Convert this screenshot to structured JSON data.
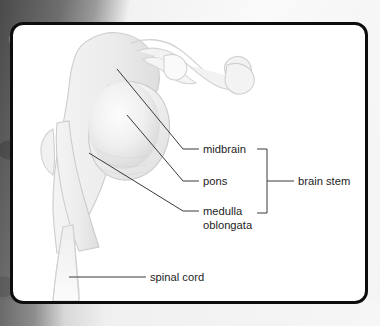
{
  "figure": {
    "background_color": "#ffffff",
    "frame_color": "#0d0d0d",
    "structure_fill": "#ececec",
    "structure_stroke": "#c8c8c8",
    "leader_line_color": "#333333",
    "labels": [
      {
        "id": "midbrain",
        "text": "midbrain"
      },
      {
        "id": "pons",
        "text": "pons"
      },
      {
        "id": "medulla",
        "text": "medulla"
      },
      {
        "id": "medulla-line2",
        "text": "oblongata"
      },
      {
        "id": "brain-stem",
        "text": "brain stem"
      },
      {
        "id": "spinal-cord",
        "text": "spinal cord"
      }
    ],
    "grouping_bracket": {
      "label": "brain stem",
      "groups": [
        "midbrain",
        "pons",
        "medulla oblongata"
      ]
    }
  }
}
